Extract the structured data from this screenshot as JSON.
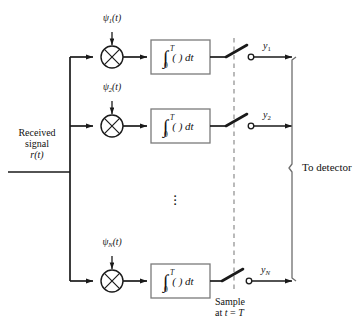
{
  "figure": {
    "type": "block-diagram",
    "colors": {
      "line": "#1a1a1a",
      "box_border": "#7a7a7a",
      "dashed": "#8c8c8c",
      "background": "#ffffff"
    }
  },
  "input": {
    "line1": "Received",
    "line2": "signal",
    "line3_var": "r",
    "line3_arg": "(t)"
  },
  "branches": [
    {
      "id": "branch-1",
      "psi_symbol": "ψ",
      "psi_sub": "1",
      "psi_arg": "(t)",
      "multiplier": "⊗",
      "integrator": "∫",
      "integrator_upper": "T",
      "integrator_lower": "0",
      "integrator_body": "( ) dt",
      "output_var": "y",
      "output_sub": "1"
    },
    {
      "id": "branch-2",
      "psi_symbol": "ψ",
      "psi_sub": "2",
      "psi_arg": "(t)",
      "multiplier": "⊗",
      "integrator": "∫",
      "integrator_upper": "T",
      "integrator_lower": "0",
      "integrator_body": "( ) dt",
      "output_var": "y",
      "output_sub": "2"
    },
    {
      "id": "branch-n",
      "psi_symbol": "ψ",
      "psi_sub": "N",
      "psi_arg": "(t)",
      "multiplier": "⊗",
      "integrator": "∫",
      "integrator_upper": "T",
      "integrator_lower": "0",
      "integrator_body": "( ) dt",
      "output_var": "y",
      "output_sub": "N"
    }
  ],
  "ellipsis": "⋮",
  "sample": {
    "line1": "Sample",
    "line2_prefix": "at ",
    "line2_var": "t",
    "line2_eq": " = ",
    "line2_val": "T"
  },
  "detector": {
    "label": "To detector"
  }
}
